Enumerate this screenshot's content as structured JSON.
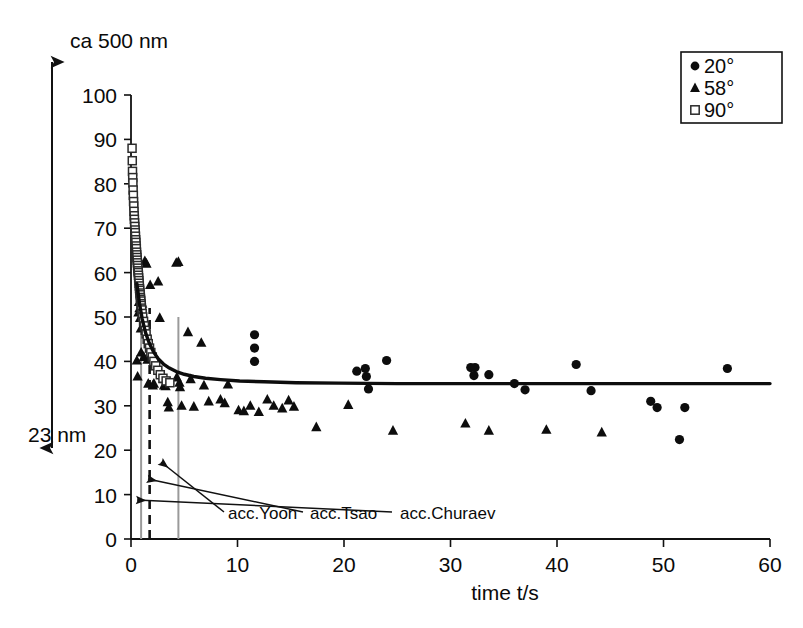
{
  "figure": {
    "top_left_label": "ca 500 nm",
    "bottom_left_label": "23 nm"
  },
  "legend": {
    "position": "top-right",
    "entries": [
      {
        "label": "20°",
        "marker": "filled-circle"
      },
      {
        "label": "58°",
        "marker": "filled-triangle"
      },
      {
        "label": "90°",
        "marker": "open-square"
      }
    ]
  },
  "annotations": [
    {
      "name": "acc-yoon",
      "label": "acc.Yoon",
      "target_t": 0.95
    },
    {
      "name": "acc-tsao",
      "label": "acc.Tsao",
      "target_t": 1.75
    },
    {
      "name": "acc-churaev",
      "label": "acc.Churaev",
      "target_t": 4.45
    }
  ],
  "chart_data": {
    "type": "scatter",
    "title": "",
    "xlabel": "time t/s",
    "ylabel": "",
    "xlim": [
      0,
      60
    ],
    "ylim": [
      0,
      100
    ],
    "xticks": [
      0,
      10,
      20,
      30,
      40,
      50,
      60
    ],
    "yticks": [
      0,
      10,
      20,
      30,
      40,
      50,
      60,
      70,
      80,
      90,
      100
    ],
    "grid": false,
    "legend_position": "top-right",
    "axis_note_top": "ca 500 nm",
    "axis_note_bottom": "23 nm",
    "series": [
      {
        "name": "20°",
        "marker": "filled-circle",
        "color": "#0d0d0d",
        "points": [
          [
            11.6,
            46.0
          ],
          [
            11.6,
            43.0
          ],
          [
            11.6,
            40.0
          ],
          [
            21.2,
            37.8
          ],
          [
            22.0,
            38.4
          ],
          [
            22.1,
            36.6
          ],
          [
            22.3,
            33.8
          ],
          [
            24.0,
            40.2
          ],
          [
            31.9,
            38.6
          ],
          [
            32.3,
            38.6
          ],
          [
            32.2,
            36.8
          ],
          [
            33.6,
            37.0
          ],
          [
            36.0,
            35.0
          ],
          [
            37.0,
            33.6
          ],
          [
            41.8,
            39.3
          ],
          [
            43.2,
            33.4
          ],
          [
            48.8,
            31.0
          ],
          [
            49.4,
            29.6
          ],
          [
            51.5,
            22.4
          ],
          [
            52.0,
            29.6
          ],
          [
            56.0,
            38.4
          ]
        ]
      },
      {
        "name": "58°",
        "marker": "filled-triangle",
        "color": "#0d0d0d",
        "points": [
          [
            0.55,
            40.2
          ],
          [
            0.62,
            36.6
          ],
          [
            0.7,
            51.0
          ],
          [
            0.75,
            53.4
          ],
          [
            0.8,
            52.0
          ],
          [
            0.85,
            49.8
          ],
          [
            0.92,
            47.4
          ],
          [
            0.95,
            42.0
          ],
          [
            1.05,
            53.0
          ],
          [
            1.1,
            50.8
          ],
          [
            1.15,
            48.0
          ],
          [
            1.2,
            41.0
          ],
          [
            1.3,
            62.6
          ],
          [
            1.45,
            62.0
          ],
          [
            1.55,
            40.4
          ],
          [
            1.62,
            35.0
          ],
          [
            1.8,
            57.2
          ],
          [
            1.95,
            41.0
          ],
          [
            2.05,
            34.6
          ],
          [
            2.15,
            35.0
          ],
          [
            2.55,
            58.0
          ],
          [
            2.7,
            49.8
          ],
          [
            3.05,
            36.0
          ],
          [
            3.1,
            34.6
          ],
          [
            3.25,
            34.4
          ],
          [
            3.45,
            30.8
          ],
          [
            3.55,
            29.6
          ],
          [
            4.25,
            62.2
          ],
          [
            4.45,
            62.4
          ],
          [
            4.3,
            36.4
          ],
          [
            4.55,
            35.2
          ],
          [
            4.6,
            34.2
          ],
          [
            4.75,
            30.0
          ],
          [
            5.35,
            46.6
          ],
          [
            5.6,
            36.0
          ],
          [
            5.9,
            29.8
          ],
          [
            6.6,
            44.2
          ],
          [
            6.85,
            34.6
          ],
          [
            7.3,
            31.0
          ],
          [
            8.4,
            31.4
          ],
          [
            8.8,
            30.6
          ],
          [
            9.1,
            34.8
          ],
          [
            10.1,
            29.0
          ],
          [
            10.6,
            28.8
          ],
          [
            11.2,
            30.0
          ],
          [
            12.0,
            28.6
          ],
          [
            12.8,
            31.4
          ],
          [
            13.4,
            30.0
          ],
          [
            14.2,
            29.4
          ],
          [
            14.8,
            31.2
          ],
          [
            15.3,
            29.8
          ],
          [
            17.4,
            25.2
          ],
          [
            20.4,
            30.2
          ],
          [
            24.6,
            24.4
          ],
          [
            31.4,
            26.0
          ],
          [
            33.6,
            24.4
          ],
          [
            39.0,
            24.6
          ],
          [
            44.2,
            24.0
          ]
        ]
      },
      {
        "name": "90°",
        "marker": "open-square",
        "color": "#2b2b2b",
        "points": [
          [
            0.1,
            88.0
          ],
          [
            0.12,
            85.2
          ],
          [
            0.14,
            82.8
          ],
          [
            0.16,
            81.4
          ],
          [
            0.18,
            80.2
          ],
          [
            0.2,
            78.6
          ],
          [
            0.22,
            77.4
          ],
          [
            0.24,
            76.0
          ],
          [
            0.26,
            75.0
          ],
          [
            0.28,
            73.8
          ],
          [
            0.3,
            72.8
          ],
          [
            0.32,
            72.0
          ],
          [
            0.34,
            71.2
          ],
          [
            0.36,
            70.4
          ],
          [
            0.38,
            69.6
          ],
          [
            0.4,
            69.0
          ],
          [
            0.42,
            68.2
          ],
          [
            0.44,
            67.4
          ],
          [
            0.46,
            66.8
          ],
          [
            0.48,
            66.0
          ],
          [
            0.5,
            65.4
          ],
          [
            0.52,
            64.6
          ],
          [
            0.54,
            64.0
          ],
          [
            0.56,
            63.4
          ],
          [
            0.58,
            62.8
          ],
          [
            0.6,
            62.2
          ],
          [
            0.62,
            61.6
          ],
          [
            0.64,
            61.0
          ],
          [
            0.66,
            60.4
          ],
          [
            0.68,
            60.0
          ],
          [
            0.7,
            59.4
          ],
          [
            0.72,
            58.8
          ],
          [
            0.74,
            58.2
          ],
          [
            0.76,
            57.6
          ],
          [
            0.78,
            57.0
          ],
          [
            0.8,
            56.4
          ],
          [
            0.82,
            56.0
          ],
          [
            0.84,
            55.4
          ],
          [
            0.86,
            55.0
          ],
          [
            0.88,
            54.4
          ],
          [
            0.9,
            54.0
          ],
          [
            0.92,
            53.6
          ],
          [
            0.94,
            53.0
          ],
          [
            0.96,
            52.6
          ],
          [
            0.98,
            52.0
          ],
          [
            1.0,
            51.6
          ],
          [
            1.05,
            50.8
          ],
          [
            1.1,
            50.0
          ],
          [
            1.18,
            49.0
          ],
          [
            1.26,
            48.0
          ],
          [
            1.34,
            47.0
          ],
          [
            1.42,
            46.2
          ],
          [
            1.52,
            45.0
          ],
          [
            1.62,
            44.0
          ],
          [
            1.74,
            43.0
          ],
          [
            1.86,
            42.0
          ],
          [
            2.0,
            41.0
          ],
          [
            2.15,
            40.0
          ],
          [
            2.32,
            39.0
          ],
          [
            2.52,
            38.0
          ],
          [
            2.75,
            37.0
          ],
          [
            3.0,
            36.2
          ],
          [
            3.3,
            35.6
          ],
          [
            3.65,
            35.2
          ]
        ]
      }
    ],
    "fit_curve": {
      "name": "fitted-decay",
      "asymptote": 35.0,
      "points": [
        [
          0.55,
          57.5
        ],
        [
          0.8,
          53.0
        ],
        [
          1.05,
          49.6
        ],
        [
          1.35,
          46.6
        ],
        [
          1.7,
          44.2
        ],
        [
          2.1,
          42.2
        ],
        [
          2.55,
          40.6
        ],
        [
          3.05,
          39.4
        ],
        [
          3.6,
          38.5
        ],
        [
          4.25,
          37.7
        ],
        [
          5.0,
          37.1
        ],
        [
          5.9,
          36.6
        ],
        [
          7.0,
          36.2
        ],
        [
          8.4,
          35.9
        ],
        [
          10.2,
          35.6
        ],
        [
          12.5,
          35.4
        ],
        [
          15.5,
          35.2
        ],
        [
          19.5,
          35.1
        ],
        [
          25.0,
          35.0
        ],
        [
          32.0,
          35.0
        ],
        [
          42.0,
          35.0
        ],
        [
          60.0,
          35.0
        ]
      ]
    },
    "reference_lines": [
      {
        "name": "acc-yoon-line",
        "t": 0.95,
        "style": "solid-gray"
      },
      {
        "name": "acc-tsao-line",
        "t": 1.75,
        "style": "dashed-black"
      },
      {
        "name": "acc-churaev-line",
        "t": 4.45,
        "style": "solid-gray"
      }
    ]
  }
}
